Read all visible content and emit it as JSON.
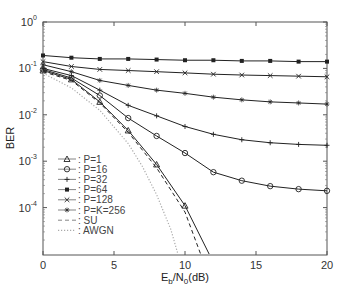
{
  "chart_data": {
    "type": "line",
    "title": "",
    "xlabel": "E_b/N_0(dB)",
    "xlabel_parts": {
      "e": "E",
      "b": "b",
      "n": "/N",
      "zero": "0",
      "unit": "(dB)"
    },
    "ylabel": "BER",
    "xlim": [
      0,
      20
    ],
    "ylim": [
      1e-05,
      1
    ],
    "yscale": "log",
    "x_ticks": [
      "0",
      "5",
      "10",
      "15",
      "20"
    ],
    "y_ticks": [
      {
        "base": "10",
        "exp": "0",
        "value": 1
      },
      {
        "base": "10",
        "exp": "-1",
        "value": 0.1
      },
      {
        "base": "10",
        "exp": "-2",
        "value": 0.01
      },
      {
        "base": "10",
        "exp": "-3",
        "value": 0.001
      },
      {
        "base": "10",
        "exp": "-4",
        "value": 0.0001
      }
    ],
    "grid": false,
    "legend_position": "lower left",
    "x": [
      0,
      2,
      4,
      6,
      8,
      10,
      12,
      14,
      16,
      18,
      20
    ],
    "series": [
      {
        "name": "P=1",
        "legend": ": P=1",
        "marker": "triangle",
        "style": "solid",
        "x": [
          0,
          2,
          4,
          6,
          8,
          10,
          11.7
        ],
        "values": [
          0.09,
          0.058,
          0.019,
          0.0046,
          0.00085,
          0.00011,
          1e-05
        ]
      },
      {
        "name": "P=16",
        "legend": ": P=16",
        "marker": "circle",
        "style": "solid",
        "x": [
          0,
          2,
          4,
          6,
          8,
          10,
          12,
          14,
          16,
          18,
          20
        ],
        "values": [
          0.095,
          0.062,
          0.026,
          0.0085,
          0.0035,
          0.0015,
          0.00058,
          0.00038,
          0.00029,
          0.00025,
          0.00023
        ]
      },
      {
        "name": "P=32",
        "legend": ": P=32",
        "marker": "plus",
        "style": "solid",
        "x": [
          0,
          2,
          4,
          6,
          8,
          10,
          12,
          14,
          16,
          18,
          20
        ],
        "values": [
          0.1,
          0.07,
          0.034,
          0.016,
          0.0095,
          0.0056,
          0.0038,
          0.0029,
          0.0025,
          0.0023,
          0.0022
        ]
      },
      {
        "name": "P=64",
        "legend": ": P=64",
        "marker": "filled-square",
        "style": "solid",
        "x": [
          0,
          2,
          4,
          6,
          8,
          10,
          12,
          14,
          16,
          18,
          20
        ],
        "values": [
          0.19,
          0.17,
          0.16,
          0.16,
          0.155,
          0.15,
          0.15,
          0.145,
          0.145,
          0.14,
          0.14
        ]
      },
      {
        "name": "P=128",
        "legend": ": P=128",
        "marker": "x",
        "style": "solid",
        "x": [
          0,
          2,
          4,
          6,
          8,
          10,
          12,
          14,
          16,
          18,
          20
        ],
        "values": [
          0.14,
          0.11,
          0.095,
          0.09,
          0.085,
          0.08,
          0.075,
          0.072,
          0.07,
          0.068,
          0.066
        ]
      },
      {
        "name": "P=K=256",
        "legend": ": P=K=256",
        "marker": "star",
        "style": "solid",
        "x": [
          0,
          2,
          4,
          6,
          8,
          10,
          12,
          14,
          16,
          18,
          20
        ],
        "values": [
          0.12,
          0.085,
          0.055,
          0.043,
          0.034,
          0.029,
          0.024,
          0.021,
          0.019,
          0.018,
          0.017
        ]
      },
      {
        "name": "SU",
        "legend": ": SU",
        "marker": "none",
        "style": "dashed",
        "x": [
          0,
          2,
          4,
          6,
          8,
          10,
          11.1
        ],
        "values": [
          0.085,
          0.055,
          0.018,
          0.0042,
          0.00072,
          8e-05,
          1e-05
        ]
      },
      {
        "name": "AWGN",
        "legend": ": AWGN",
        "marker": "none",
        "style": "dotted",
        "x": [
          0,
          2,
          4,
          6,
          7,
          8,
          9,
          9.5
        ],
        "values": [
          0.079,
          0.038,
          0.0125,
          0.0024,
          0.00077,
          0.00019,
          3.4e-05,
          1e-05
        ]
      }
    ]
  }
}
